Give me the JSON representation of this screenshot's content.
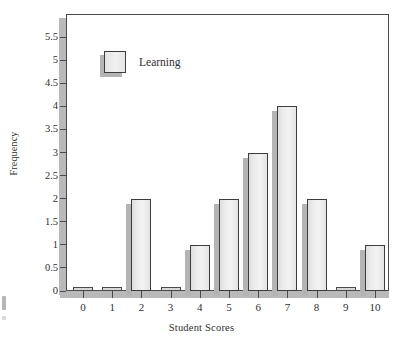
{
  "chart_data": {
    "type": "bar",
    "title": "",
    "xlabel": "Student Scores",
    "ylabel": "Frequency",
    "categories": [
      "0",
      "1",
      "2",
      "3",
      "4",
      "5",
      "6",
      "7",
      "8",
      "9",
      "10"
    ],
    "series": [
      {
        "name": "Learning",
        "values": [
          0,
          0,
          2,
          0,
          1,
          2,
          3,
          4,
          2,
          0,
          1
        ]
      }
    ],
    "values": [
      0,
      0,
      2,
      0,
      1,
      2,
      3,
      4,
      2,
      0,
      1
    ],
    "ylim": [
      0,
      6
    ],
    "yticks": [
      0,
      0.5,
      1,
      1.5,
      2,
      2.5,
      3,
      3.5,
      4,
      4.5,
      5,
      5.5
    ],
    "ytick_labels": [
      "0",
      "0.5",
      "1",
      "1.5",
      "2",
      "2.5",
      "3",
      "3.5",
      "4",
      "4.5",
      "5",
      "5.5"
    ],
    "xtick_labels": [
      "0",
      "1",
      "2",
      "3",
      "4",
      "5",
      "6",
      "7",
      "8",
      "9",
      "10"
    ],
    "grid": false,
    "legend": {
      "position": "top-left-inside",
      "entries": [
        "Learning"
      ]
    },
    "colors": {
      "bar_fill": "#eeeeee",
      "bar_edge": "#3c3c3c",
      "bar_shadow": "#b4b4b4",
      "axis": "#4a4a4a",
      "text": "#2f2f2f",
      "background": "#ffffff"
    }
  }
}
